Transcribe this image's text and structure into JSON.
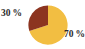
{
  "chart_data": {
    "type": "pie",
    "title": "",
    "categories": [
      "70 %",
      "30 %"
    ],
    "values": [
      70,
      30
    ],
    "labels": [
      "70 %",
      "30 %"
    ],
    "units": "percent",
    "total": 100,
    "legend": "none",
    "grid": false,
    "start_angle_deg": 90,
    "direction": "counterclockwise-for-minor-slice",
    "slices": [
      {
        "name": "major-slice",
        "label": "70 %",
        "value": 70,
        "color": "#F2BE42",
        "label_position": "outside-right-bottom"
      },
      {
        "name": "minor-slice",
        "label": "30 %",
        "value": 30,
        "color": "#8C3420",
        "label_position": "outside-left-top"
      }
    ]
  },
  "figure": {
    "background": "#FFFFFF",
    "label_color": "#2B2B2B",
    "pie_center_x": 20,
    "pie_center_y": 20,
    "pie_radius": 19.6
  },
  "labels": {
    "minor": "30 %",
    "major": "70 %"
  }
}
